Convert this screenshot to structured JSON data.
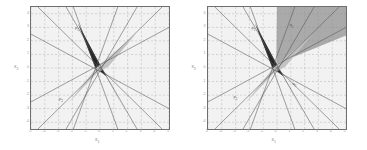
{
  "figure": {
    "caption": "",
    "panels": [
      {
        "id": "left-panel",
        "xlabel": "x",
        "xlabel_sub": "1",
        "ylabel": "x",
        "ylabel_sub": "2",
        "xticks": [
          "-5",
          "-4",
          "-3",
          "-2",
          "-1",
          "0",
          "1",
          "2",
          "3",
          "4",
          "5"
        ],
        "yticks": [
          "4",
          "3",
          "2",
          "1",
          "0",
          "-1",
          "-2",
          "-3",
          "-4"
        ],
        "annotations": [
          {
            "text": "p",
            "sub": "1",
            "x": 44,
            "y": 19
          },
          {
            "text": "p",
            "sub": "2",
            "x": 28,
            "y": 90
          }
        ]
      },
      {
        "id": "right-panel",
        "xlabel": "x",
        "xlabel_sub": "1",
        "ylabel": "x",
        "ylabel_sub": "2",
        "xticks": [
          "-5",
          "-4",
          "-3",
          "-2",
          "-1",
          "0",
          "1",
          "2",
          "3",
          "4",
          "5"
        ],
        "yticks": [
          "4",
          "3",
          "2",
          "1",
          "0",
          "-1",
          "-2",
          "-3",
          "-4"
        ],
        "annotations": [
          {
            "text": "p",
            "sub": "1",
            "x": 44,
            "y": 19
          },
          {
            "text": "p",
            "sub": "2",
            "x": 26,
            "y": 88
          },
          {
            "text": "q",
            "sub": "1",
            "x": 82,
            "y": 16
          },
          {
            "text": "q",
            "sub": "2",
            "x": 85,
            "y": 75
          }
        ]
      }
    ]
  },
  "chart_data": {
    "type": "scatter",
    "title": "",
    "xlabel": "x1",
    "ylabel": "x2",
    "xlim": [
      -5,
      5
    ],
    "ylim": [
      -4.5,
      4.5
    ],
    "grid": true,
    "legend": "none",
    "panel_count": 2,
    "colors": {
      "background": "#f2f2f2",
      "frame": "#6e6e6e",
      "gridline": "#b4b4b4",
      "line": "#555555",
      "dark_region": "#1a1a1a",
      "light_region": "#c0c0c0",
      "medium_region": "#8e8e8e"
    },
    "panels": [
      {
        "name": "left",
        "description": "Arrangement of 8 straight lines through a central point cluster; a black bow-tie (butterfly) cell spanning upper-left to lower-right and a light-grey bow-tie cell spanning lower-left to upper-right.",
        "lines": [
          {
            "slope": 1.0,
            "intercept": 0.0
          },
          {
            "slope": -1.0,
            "intercept": 0.0
          },
          {
            "slope": 1.75,
            "intercept": -0.2
          },
          {
            "slope": -1.75,
            "intercept": 0.2
          },
          {
            "slope": 0.55,
            "intercept": 0.25
          },
          {
            "slope": -0.55,
            "intercept": -0.25
          },
          {
            "slope": 2.8,
            "intercept": 0.9
          },
          {
            "slope": -2.8,
            "intercept": -0.9
          }
        ],
        "shaded_regions": [
          {
            "fill": "#1a1a1a",
            "label": "dark-bowtie",
            "vertices": [
              [
                -1.6,
                3.3
              ],
              [
                -0.05,
                0.35
              ],
              [
                1.9,
                -3.3
              ],
              [
                0.45,
                -0.6
              ],
              [
                -0.35,
                0.05
              ]
            ]
          },
          {
            "fill": "#c0c0c0",
            "label": "light-bowtie",
            "vertices": [
              [
                -2.3,
                -2.6
              ],
              [
                -0.2,
                0.1
              ],
              [
                2.6,
                2.5
              ],
              [
                0.6,
                0.1
              ],
              [
                -0.2,
                -0.35
              ]
            ]
          }
        ]
      },
      {
        "name": "right",
        "description": "Same line arrangement as the left panel plus a medium-grey cone opening upward from the centre toward the top-right corner.",
        "lines": [
          {
            "slope": 1.0,
            "intercept": 0.0
          },
          {
            "slope": -1.0,
            "intercept": 0.0
          },
          {
            "slope": 1.75,
            "intercept": -0.2
          },
          {
            "slope": -1.75,
            "intercept": 0.2
          },
          {
            "slope": 0.55,
            "intercept": 0.25
          },
          {
            "slope": -0.55,
            "intercept": -0.25
          },
          {
            "slope": 2.8,
            "intercept": 0.9
          },
          {
            "slope": -2.8,
            "intercept": -0.9
          }
        ],
        "shaded_regions": [
          {
            "fill": "#8e8e8e",
            "label": "upper-cone",
            "vertices": [
              [
                -0.05,
                0.3
              ],
              [
                0.0,
                4.5
              ],
              [
                5.0,
                4.5
              ],
              [
                5.0,
                2.4
              ]
            ]
          },
          {
            "fill": "#1a1a1a",
            "label": "dark-bowtie",
            "vertices": [
              [
                -1.6,
                3.3
              ],
              [
                -0.05,
                0.35
              ],
              [
                1.9,
                -3.3
              ],
              [
                0.45,
                -0.6
              ],
              [
                -0.35,
                0.05
              ]
            ]
          },
          {
            "fill": "#c0c0c0",
            "label": "light-bowtie",
            "vertices": [
              [
                -2.3,
                -2.6
              ],
              [
                -0.2,
                0.1
              ],
              [
                2.6,
                2.5
              ],
              [
                0.6,
                0.1
              ],
              [
                -0.2,
                -0.35
              ]
            ]
          }
        ]
      }
    ]
  }
}
